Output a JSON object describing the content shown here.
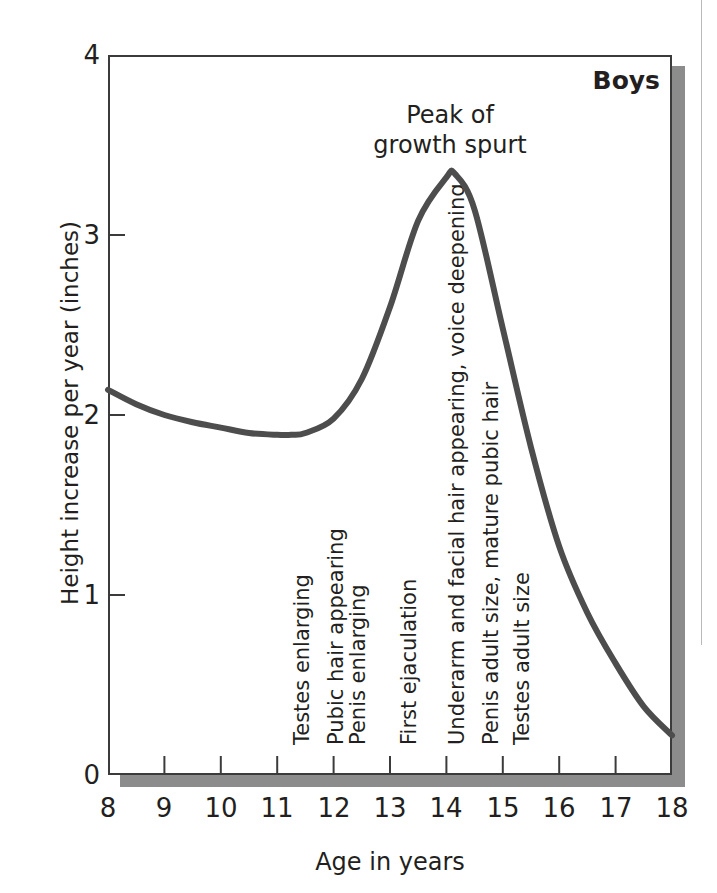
{
  "chart_data": {
    "type": "line",
    "title": "",
    "series_label": "Boys",
    "xlabel": "Age in years",
    "ylabel": "Height increase per year (inches)",
    "xlim": [
      8,
      18
    ],
    "ylim": [
      0,
      4
    ],
    "grid": false,
    "legend_position": "none",
    "xticks": [
      "8",
      "9",
      "10",
      "11",
      "12",
      "13",
      "14",
      "15",
      "16",
      "17",
      "18"
    ],
    "yticks": [
      "0",
      "1",
      "2",
      "3",
      "4"
    ],
    "x": [
      8,
      8.5,
      9,
      9.5,
      10,
      10.5,
      11,
      11.25,
      11.5,
      12,
      12.5,
      13,
      13.5,
      14,
      14.15,
      14.5,
      15,
      15.5,
      16,
      16.5,
      17,
      17.5,
      18
    ],
    "values": [
      2.14,
      2.06,
      2.0,
      1.96,
      1.93,
      1.9,
      1.89,
      1.89,
      1.9,
      1.98,
      2.2,
      2.6,
      3.08,
      3.32,
      3.34,
      3.14,
      2.48,
      1.82,
      1.27,
      0.9,
      0.62,
      0.38,
      0.22
    ],
    "series": [
      {
        "name": "Boys",
        "color": "#4d4d4d",
        "values": [
          2.14,
          2.06,
          2.0,
          1.96,
          1.93,
          1.9,
          1.89,
          1.89,
          1.9,
          1.98,
          2.2,
          2.6,
          3.08,
          3.32,
          3.34,
          3.14,
          2.48,
          1.82,
          1.27,
          0.9,
          0.62,
          0.38,
          0.22
        ]
      }
    ],
    "annotations": [
      {
        "text": "Peak of\ngrowth spurt",
        "x": 14.1,
        "y": 3.75,
        "kind": "callout"
      }
    ],
    "event_markers": [
      {
        "label": "Testes enlarging",
        "age": 11.1
      },
      {
        "label": "Pubic hair appearing",
        "age": 11.7
      },
      {
        "label": "Penis enlarging",
        "age": 12.1
      },
      {
        "label": "First ejaculation",
        "age": 13.0
      },
      {
        "label": "Underarm and facial hair appearing, voice deepening",
        "age": 13.9
      },
      {
        "label": "Penis adult size, mature pubic hair",
        "age": 14.5
      },
      {
        "label": "Testes adult size",
        "age": 15.0
      }
    ]
  },
  "peak_note": {
    "line1": "Peak of",
    "line2": "growth spurt"
  }
}
